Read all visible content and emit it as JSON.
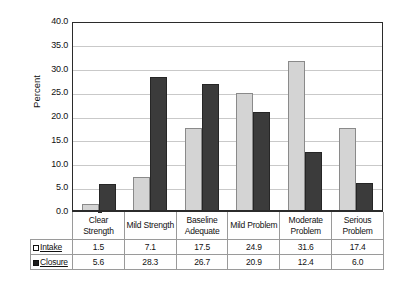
{
  "chart_data": {
    "type": "bar",
    "title": "",
    "xlabel": "",
    "ylabel": "Percent",
    "ylim": [
      0,
      40
    ],
    "ytick_step": 5,
    "ytick_labels": [
      "0.0",
      "5.0",
      "10.0",
      "15.0",
      "20.0",
      "25.0",
      "30.0",
      "35.0",
      "40.0"
    ],
    "grid": "horizontal",
    "legend_position": "data-table",
    "categories": [
      "Clear Strength",
      "Mild Strength",
      "Baseline Adequate",
      "Mild Problem",
      "Moderate Problem",
      "Serious Problem"
    ],
    "category_lines": [
      [
        "Clear",
        "Strength"
      ],
      [
        "Mild Strength"
      ],
      [
        "Baseline",
        "Adequate"
      ],
      [
        "Mild Problem"
      ],
      [
        "Moderate",
        "Problem"
      ],
      [
        "Serious",
        "Problem"
      ]
    ],
    "series": [
      {
        "name": "Intake",
        "color": "#d4d4d4",
        "values": [
          1.5,
          7.1,
          17.5,
          24.9,
          31.6,
          17.4
        ],
        "labels": [
          "1.5",
          "7.1",
          "17.5",
          "24.9",
          "31.6",
          "17.4"
        ]
      },
      {
        "name": "Closure",
        "color": "#3b3b3b",
        "values": [
          5.6,
          28.3,
          26.7,
          20.9,
          12.4,
          6.0
        ],
        "labels": [
          "5.6",
          "28.3",
          "26.7",
          "20.9",
          "12.4",
          "6.0"
        ]
      }
    ]
  },
  "colors": {
    "intake": "#d4d4d4",
    "closure": "#3b3b3b",
    "axis": "#2b2b2b",
    "grid": "#c9c9c9",
    "background": "#ffffff"
  }
}
